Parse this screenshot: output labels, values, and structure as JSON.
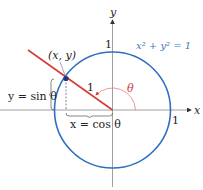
{
  "diagram": {
    "colors": {
      "circle": "#2f6fc0",
      "ray": "#d83a3a",
      "angle_arc": "#e07070",
      "axis": "#777777",
      "text": "#222222"
    },
    "axes": {
      "x_label": "x",
      "y_label": "y",
      "x_tick_label": "1",
      "y_tick_label": "1"
    },
    "circle_equation": "x² + y² = 1",
    "point_label": "(x, y)",
    "radius_label": "1",
    "angle_label": "θ",
    "sin_label": "y = sin θ",
    "cos_label": "x = cos θ"
  }
}
